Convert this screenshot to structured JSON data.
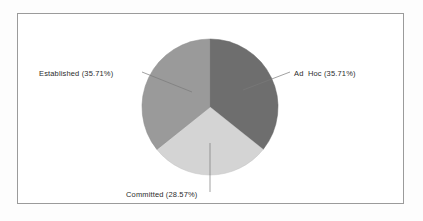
{
  "figure": {
    "background_color": "#fdfdfd",
    "plot_background_color": "#ffffff",
    "border_color": "#9b9b9b"
  },
  "chart_data": {
    "type": "pie",
    "title": "",
    "subtitle": "",
    "xlabel": "",
    "ylabel": "",
    "legend_position": "none",
    "grid": false,
    "labels_outside": true,
    "start_angle_deg": 0,
    "direction": "clockwise",
    "categories": [
      "Ad  Hoc",
      "Committed",
      "Established"
    ],
    "values": [
      35.71,
      28.57,
      35.71
    ],
    "slices": [
      {
        "name": "Ad  Hoc",
        "value": 35.71,
        "percent_text": "35.71%",
        "label": "Ad  Hoc (35.71%)",
        "color": "#6e6e6e",
        "start_deg": 0,
        "end_deg": 128.556
      },
      {
        "name": "Committed",
        "value": 28.57,
        "percent_text": "28.57%",
        "label": "Committed (28.57%)",
        "color": "#d4d4d4",
        "start_deg": 128.556,
        "end_deg": 231.408
      },
      {
        "name": "Established",
        "value": 35.71,
        "percent_text": "35.71%",
        "label": "Established (35.71%)",
        "color": "#9a9a9a",
        "start_deg": 231.408,
        "end_deg": 360
      }
    ]
  },
  "labels": {
    "established": "Established (35.71%)",
    "ad_hoc": "Ad  Hoc (35.71%)",
    "committed": "Committed (28.57%)"
  }
}
